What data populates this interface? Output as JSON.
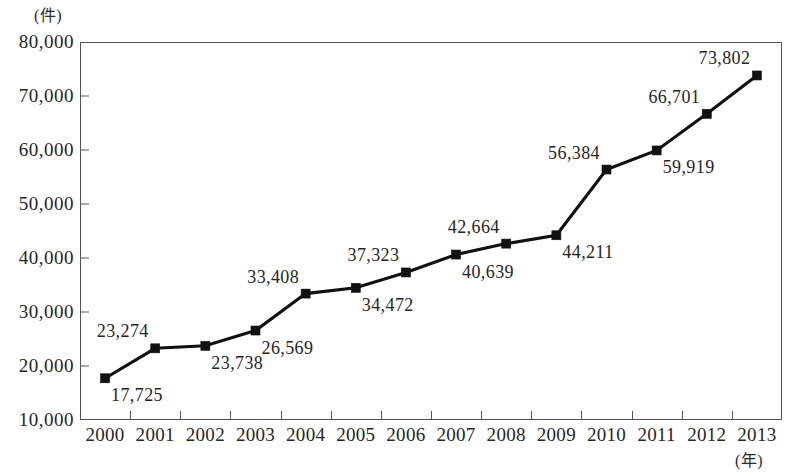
{
  "chart_data": {
    "type": "line",
    "title": "",
    "xlabel": "(年)",
    "ylabel": "(件)",
    "categories": [
      "2000",
      "2001",
      "2002",
      "2003",
      "2004",
      "2005",
      "2006",
      "2007",
      "2008",
      "2009",
      "2010",
      "2011",
      "2012",
      "2013"
    ],
    "values": [
      17725,
      23274,
      23738,
      26569,
      33408,
      34472,
      37323,
      40639,
      42664,
      44211,
      56384,
      59919,
      66701,
      73802
    ],
    "value_labels": [
      "17,725",
      "23,274",
      "23,738",
      "26,569",
      "33,408",
      "34,472",
      "37,323",
      "40,639",
      "42,664",
      "44,211",
      "56,384",
      "59,919",
      "66,701",
      "73,802"
    ],
    "label_positions": [
      "below",
      "above",
      "below",
      "below",
      "above",
      "below",
      "above",
      "below",
      "above",
      "below",
      "above",
      "below",
      "above",
      "above"
    ],
    "ylim": [
      10000,
      80000
    ],
    "ytick_labels": [
      "80,000",
      "70,000",
      "60,000",
      "50,000",
      "40,000",
      "30,000",
      "20,000",
      "10,000"
    ],
    "ytick_values": [
      80000,
      70000,
      60000,
      50000,
      40000,
      30000,
      20000,
      10000
    ],
    "grid": false,
    "legend": "none",
    "series_color": "#111111",
    "marker": "square",
    "axis_color": "#555555"
  }
}
